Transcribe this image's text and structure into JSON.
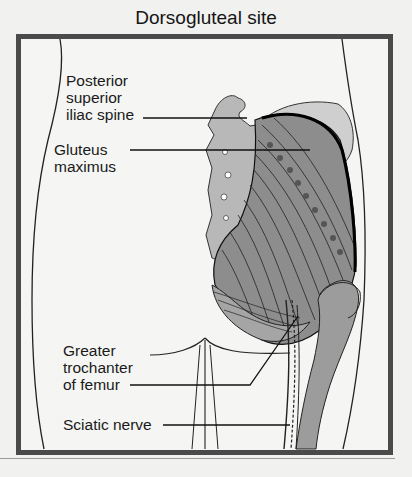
{
  "figure": {
    "title": "Dorsogluteal site",
    "labels": [
      {
        "id": "psis",
        "text": "Posterior\nsuperior\niliac spine"
      },
      {
        "id": "gluteus",
        "text": "Gluteus\nmaximus"
      },
      {
        "id": "trochanter",
        "text": "Greater\ntrochanter\nof femur"
      },
      {
        "id": "sciatic",
        "text": "Sciatic nerve"
      }
    ]
  },
  "colors": {
    "frame": "#4a4a4a",
    "muscle": "#8a8a8a",
    "bone": "#b8b8b8",
    "femur": "#9c9c9c",
    "line": "#1a1a1a"
  }
}
